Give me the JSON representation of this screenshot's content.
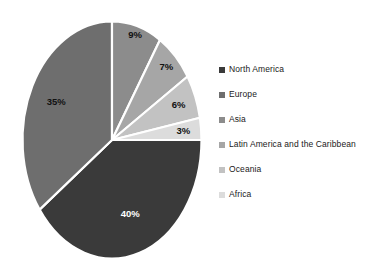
{
  "chart_data": {
    "type": "pie",
    "title": "",
    "subtitle": "",
    "xlabel": "",
    "ylabel": "",
    "grid": false,
    "legend_position": "right",
    "units": "percent",
    "total": 100,
    "categories": [
      "North America",
      "Europe",
      "Asia",
      "Latin America and the Caribbean",
      "Oceania",
      "Africa"
    ],
    "values": [
      40,
      35,
      9,
      7,
      6,
      3
    ],
    "data_labels": [
      "40%",
      "35%",
      "9%",
      "7%",
      "6%",
      "3%"
    ],
    "colors": [
      "#3a3a3a",
      "#6e6e6e",
      "#8c8c8c",
      "#a6a6a6",
      "#c2c2c2",
      "#dcdcdc"
    ],
    "label_colors": [
      "#ffffff",
      "#111111",
      "#111111",
      "#111111",
      "#111111",
      "#111111"
    ],
    "slices": [
      {
        "name": "North America",
        "value": 40,
        "label": "40%",
        "color": "#3a3a3a"
      },
      {
        "name": "Europe",
        "value": 35,
        "label": "35%",
        "color": "#6e6e6e"
      },
      {
        "name": "Asia",
        "value": 9,
        "label": "9%",
        "color": "#8c8c8c"
      },
      {
        "name": "Latin America and the Caribbean",
        "value": 7,
        "label": "7%",
        "color": "#a6a6a6"
      },
      {
        "name": "Oceania",
        "value": 6,
        "label": "6%",
        "color": "#c2c2c2"
      },
      {
        "name": "Africa",
        "value": 3,
        "label": "3%",
        "color": "#dcdcdc"
      }
    ]
  },
  "legend": {
    "items": [
      {
        "label": "North America",
        "color": "#3a3a3a"
      },
      {
        "label": "Europe",
        "color": "#6e6e6e"
      },
      {
        "label": "Asia",
        "color": "#8c8c8c"
      },
      {
        "label": "Latin America and the Caribbean",
        "color": "#a6a6a6"
      },
      {
        "label": "Oceania",
        "color": "#c2c2c2"
      },
      {
        "label": "Africa",
        "color": "#dcdcdc"
      }
    ]
  },
  "canvas": {
    "background": "#ffffff"
  }
}
